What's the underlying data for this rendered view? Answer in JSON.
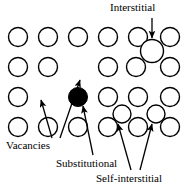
{
  "figure": {
    "background_color": "#ffffff",
    "stroke_color": "#000000",
    "fill_atom_color": "#000000",
    "open_atom_fill": "#ffffff"
  },
  "labels": {
    "interstitial": "Interstitial",
    "vacancies": "Vacancies",
    "substitutional": "Substitutional",
    "self_interstitial": "Self-interstitial"
  },
  "chart_data": {
    "type": "scatter",
    "xlabel": "",
    "ylabel": "",
    "grid": false,
    "legend": "none",
    "xlim": [
      0,
      184
    ],
    "ylim": [
      0,
      187
    ],
    "lattice": {
      "rows": 4,
      "columns": 6,
      "column_x": [
        18,
        48,
        78,
        108,
        138,
        168
      ],
      "row_y": [
        37,
        67,
        97,
        127
      ],
      "radius": 9.5,
      "stroke_width": 1.4
    },
    "atoms": [
      {
        "id": "r1c1",
        "x": 18,
        "y": 37,
        "r": 9.5,
        "kind": "lattice-atom",
        "fill": "#ffffff"
      },
      {
        "id": "r1c2",
        "x": 48,
        "y": 37,
        "r": 9.5,
        "kind": "lattice-atom",
        "fill": "#ffffff"
      },
      {
        "id": "r1c3",
        "x": 78,
        "y": 37,
        "r": 9.5,
        "kind": "lattice-atom",
        "fill": "#ffffff"
      },
      {
        "id": "r1c4",
        "x": 108,
        "y": 37,
        "r": 9.5,
        "kind": "lattice-atom",
        "fill": "#ffffff"
      },
      {
        "id": "r1c5",
        "x": 138,
        "y": 37,
        "r": 9.5,
        "kind": "lattice-atom",
        "fill": "#ffffff"
      },
      {
        "id": "r1c6",
        "x": 170,
        "y": 37,
        "r": 9.5,
        "kind": "lattice-atom",
        "fill": "#ffffff"
      },
      {
        "id": "r2c1",
        "x": 18,
        "y": 67,
        "r": 9.5,
        "kind": "lattice-atom",
        "fill": "#ffffff"
      },
      {
        "id": "r2c2",
        "x": 48,
        "y": 67,
        "r": 9.5,
        "kind": "lattice-atom",
        "fill": "#ffffff"
      },
      {
        "id": "r2c4",
        "x": 108,
        "y": 67,
        "r": 9.5,
        "kind": "lattice-atom",
        "fill": "#ffffff"
      },
      {
        "id": "r2c5",
        "x": 136,
        "y": 67,
        "r": 9.5,
        "kind": "lattice-atom",
        "fill": "#ffffff"
      },
      {
        "id": "r2c6",
        "x": 170,
        "y": 67,
        "r": 9.5,
        "kind": "lattice-atom",
        "fill": "#ffffff"
      },
      {
        "id": "r3c1",
        "x": 18,
        "y": 97,
        "r": 9.5,
        "kind": "lattice-atom",
        "fill": "#ffffff"
      },
      {
        "id": "r3c4",
        "x": 108,
        "y": 97,
        "r": 9.5,
        "kind": "lattice-atom",
        "fill": "#ffffff"
      },
      {
        "id": "r3c5",
        "x": 138,
        "y": 97,
        "r": 9.5,
        "kind": "lattice-atom",
        "fill": "#ffffff"
      },
      {
        "id": "r3c6",
        "x": 170,
        "y": 97,
        "r": 9.5,
        "kind": "lattice-atom",
        "fill": "#ffffff"
      },
      {
        "id": "r4c1",
        "x": 18,
        "y": 127,
        "r": 9.5,
        "kind": "lattice-atom",
        "fill": "#ffffff"
      },
      {
        "id": "r4c2",
        "x": 48,
        "y": 127,
        "r": 9.5,
        "kind": "lattice-atom",
        "fill": "#ffffff"
      },
      {
        "id": "r4c3",
        "x": 78,
        "y": 127,
        "r": 9.5,
        "kind": "lattice-atom",
        "fill": "#ffffff"
      },
      {
        "id": "r4c4",
        "x": 108,
        "y": 127,
        "r": 9.5,
        "kind": "lattice-atom",
        "fill": "#ffffff"
      },
      {
        "id": "r4c5",
        "x": 138,
        "y": 127,
        "r": 9.5,
        "kind": "lattice-atom",
        "fill": "#ffffff"
      },
      {
        "id": "r4c6",
        "x": 170,
        "y": 127,
        "r": 9.5,
        "kind": "lattice-atom",
        "fill": "#ffffff"
      }
    ],
    "defects": [
      {
        "id": "substitutional-atom",
        "x": 78,
        "y": 97,
        "r": 9.5,
        "kind": "substitutional",
        "fill": "#000000"
      },
      {
        "id": "interstitial-atom",
        "x": 152,
        "y": 51,
        "r": 11.5,
        "kind": "interstitial",
        "fill": "#ffffff"
      },
      {
        "id": "self-interstitial-1",
        "x": 122,
        "y": 114,
        "r": 9.0,
        "kind": "self-interstitial",
        "fill": "#ffffff"
      },
      {
        "id": "self-interstitial-2",
        "x": 156,
        "y": 114,
        "r": 9.0,
        "kind": "self-interstitial",
        "fill": "#ffffff"
      }
    ],
    "vacancies": [
      {
        "id": "vacancy-1",
        "x": 78,
        "y": 67,
        "label": "row 2, column 3 empty site"
      },
      {
        "id": "vacancy-2",
        "x": 48,
        "y": 97,
        "label": "row 3, column 2 empty site"
      }
    ],
    "arrows": [
      {
        "id": "arrow-interstitial",
        "from": [
          152,
          18
        ],
        "to": [
          152,
          38
        ],
        "points_to": "interstitial-atom"
      },
      {
        "id": "arrow-vacancy-1",
        "from": [
          60,
          138
        ],
        "to": [
          80,
          80
        ],
        "points_to": "vacancy-1"
      },
      {
        "id": "arrow-vacancy-2",
        "from": [
          52,
          138
        ],
        "to": [
          41,
          100
        ],
        "points_to": "vacancy-2"
      },
      {
        "id": "arrow-substitutional",
        "from": [
          93,
          155
        ],
        "to": [
          83,
          106
        ],
        "points_to": "substitutional-atom"
      },
      {
        "id": "arrow-self-interstitial-1",
        "from": [
          131,
          170
        ],
        "to": [
          118,
          124
        ],
        "points_to": "self-interstitial-1"
      },
      {
        "id": "arrow-self-interstitial-2",
        "from": [
          140,
          170
        ],
        "to": [
          152,
          124
        ],
        "points_to": "self-interstitial-2"
      }
    ]
  }
}
